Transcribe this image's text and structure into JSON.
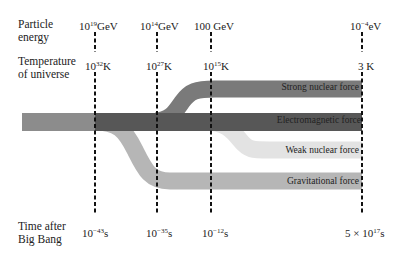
{
  "rows": {
    "energy": {
      "line1": "Particle",
      "line2": "energy"
    },
    "temperature": {
      "line1": "Temperature",
      "line2": "of universe"
    },
    "time": {
      "line1": "Time after",
      "line2": "Big Bang"
    }
  },
  "epochs": [
    {
      "energy_base": "10",
      "energy_exp": "19",
      "energy_unit": "GeV",
      "temp_base": "10",
      "temp_exp": "32",
      "temp_unit": "K",
      "time_base": "10",
      "time_exp": "−43",
      "time_unit": "s",
      "x": 95
    },
    {
      "energy_base": "10",
      "energy_exp": "14",
      "energy_unit": "GeV",
      "temp_base": "10",
      "temp_exp": "27",
      "temp_unit": "K",
      "time_base": "10",
      "time_exp": "−35",
      "time_unit": "s",
      "x": 157
    },
    {
      "energy_base": "100",
      "energy_exp": "",
      "energy_unit": " GeV",
      "temp_base": "10",
      "temp_exp": "15",
      "temp_unit": "K",
      "time_base": "10",
      "time_exp": "−12",
      "time_unit": "s",
      "x": 211
    },
    {
      "energy_base": "10",
      "energy_exp": "−4",
      "energy_unit": "eV",
      "temp_base": "3",
      "temp_exp": "",
      "temp_unit": " K",
      "time_base": "5 × 10",
      "time_exp": "17",
      "time_unit": "s",
      "x": 362
    }
  ],
  "forces": [
    {
      "name": "Strong nuclear force",
      "color": "#7a7a7a"
    },
    {
      "name": "Electromagnetic force",
      "color": "#575757",
      "early_color": "#8c8c8c"
    },
    {
      "name": "Weak nuclear force",
      "color": "#e3e3e3"
    },
    {
      "name": "Gravitational force",
      "color": "#b6b6b6"
    }
  ]
}
